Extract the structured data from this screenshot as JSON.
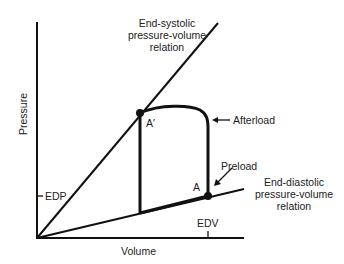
{
  "diagram": {
    "type": "pressure-volume loop",
    "axes": {
      "x_label": "Volume",
      "y_label": "Pressure",
      "x_tick": "EDV",
      "y_tick": "EDP"
    },
    "curves": {
      "end_systolic": {
        "label_line1": "End-systolic",
        "label_line2": "pressure-volume",
        "label_line3": "relation"
      },
      "end_diastolic": {
        "label_line1": "End-diastolic",
        "label_line2": "pressure-volume",
        "label_line3": "relation"
      }
    },
    "points": {
      "a_prime": "A′",
      "a": "A"
    },
    "annotations": {
      "afterload": "Afterload",
      "preload": "Preload"
    },
    "colors": {
      "line": "#111111",
      "background": "#ffffff"
    }
  }
}
